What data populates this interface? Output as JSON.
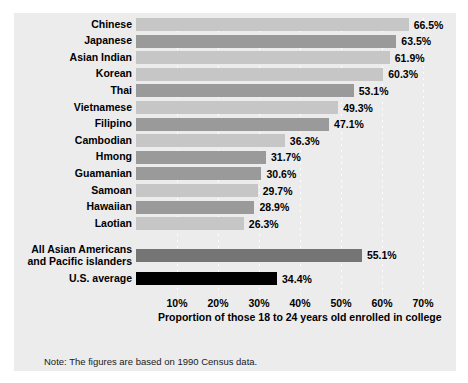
{
  "note": "Note: The figures are based on 1990 Census data.",
  "axis": {
    "xlabel": "Proportion of those 18 to 24 years old enrolled in college",
    "ticks": [
      "10%",
      "20%",
      "30%",
      "40%",
      "50%",
      "60%",
      "70%"
    ]
  },
  "colors": {
    "panel": "#ececed",
    "bar_light": "#c6c6c6",
    "bar_medium": "#9a9a9a",
    "bar_aggregate": "#757575",
    "bar_us_average": "#000000",
    "gridline": "#ffffff",
    "text": "#000000"
  },
  "chart_data": {
    "type": "bar",
    "orientation": "horizontal",
    "title": "",
    "xlabel": "Proportion of those 18 to 24 years old enrolled in college",
    "ylabel": "",
    "xlim": [
      0,
      75
    ],
    "xticks": [
      10,
      20,
      30,
      40,
      50,
      60,
      70
    ],
    "grid": true,
    "legend": false,
    "value_suffix": "%",
    "categories": [
      "Chinese",
      "Japanese",
      "Asian Indian",
      "Korean",
      "Thai",
      "Vietnamese",
      "Filipino",
      "Cambodian",
      "Hmong",
      "Guamanian",
      "Samoan",
      "Hawaiian",
      "Laotian",
      "All Asian Americans and Pacific islanders",
      "U.S. average"
    ],
    "values": [
      66.5,
      63.5,
      61.9,
      60.3,
      53.1,
      49.3,
      47.1,
      36.3,
      31.7,
      30.6,
      29.7,
      28.9,
      26.3,
      55.1,
      34.4
    ],
    "labels": [
      "66.5%",
      "63.5%",
      "61.9%",
      "60.3%",
      "53.1%",
      "49.3%",
      "47.1%",
      "36.3%",
      "31.7%",
      "30.6%",
      "29.7%",
      "28.9%",
      "26.3%",
      "55.1%",
      "34.4%"
    ],
    "bars": [
      {
        "category": "Chinese",
        "value": 66.5,
        "label": "66.5%",
        "color": "#c6c6c6",
        "group": "group"
      },
      {
        "category": "Japanese",
        "value": 63.5,
        "label": "63.5%",
        "color": "#9a9a9a",
        "group": "group"
      },
      {
        "category": "Asian Indian",
        "value": 61.9,
        "label": "61.9%",
        "color": "#c6c6c6",
        "group": "group"
      },
      {
        "category": "Korean",
        "value": 60.3,
        "label": "60.3%",
        "color": "#c6c6c6",
        "group": "group"
      },
      {
        "category": "Thai",
        "value": 53.1,
        "label": "53.1%",
        "color": "#9a9a9a",
        "group": "group"
      },
      {
        "category": "Vietnamese",
        "value": 49.3,
        "label": "49.3%",
        "color": "#c6c6c6",
        "group": "group"
      },
      {
        "category": "Filipino",
        "value": 47.1,
        "label": "47.1%",
        "color": "#9a9a9a",
        "group": "group"
      },
      {
        "category": "Cambodian",
        "value": 36.3,
        "label": "36.3%",
        "color": "#c6c6c6",
        "group": "group"
      },
      {
        "category": "Hmong",
        "value": 31.7,
        "label": "31.7%",
        "color": "#9a9a9a",
        "group": "group"
      },
      {
        "category": "Guamanian",
        "value": 30.6,
        "label": "30.6%",
        "color": "#9a9a9a",
        "group": "group"
      },
      {
        "category": "Samoan",
        "value": 29.7,
        "label": "29.7%",
        "color": "#c6c6c6",
        "group": "group"
      },
      {
        "category": "Hawaiian",
        "value": 28.9,
        "label": "28.9%",
        "color": "#9a9a9a",
        "group": "group"
      },
      {
        "category": "Laotian",
        "value": 26.3,
        "label": "26.3%",
        "color": "#c6c6c6",
        "group": "group"
      },
      {
        "category": "All Asian Americans and Pacific islanders",
        "value": 55.1,
        "label": "55.1%",
        "color": "#757575",
        "group": "aggregate",
        "label_line1": "All Asian Americans",
        "label_line2": "and Pacific islanders"
      },
      {
        "category": "U.S. average",
        "value": 34.4,
        "label": "34.4%",
        "color": "#000000",
        "group": "aggregate"
      }
    ]
  }
}
